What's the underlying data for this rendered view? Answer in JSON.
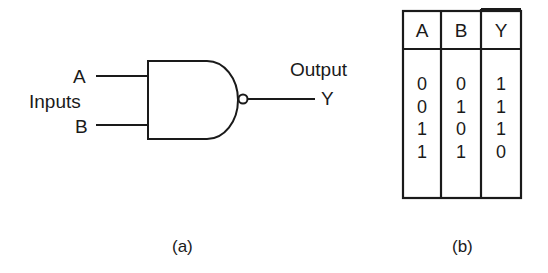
{
  "gate": {
    "type": "NAND",
    "inputs_label": "Inputs",
    "input_a_label": "A",
    "input_b_label": "B",
    "output_label": "Output",
    "output_y_label": "Y"
  },
  "truth_table": {
    "headers": [
      "A",
      "B",
      "Y"
    ],
    "columns": {
      "A": [
        "0",
        "0",
        "1",
        "1"
      ],
      "B": [
        "0",
        "1",
        "0",
        "1"
      ],
      "Y": [
        "1",
        "1",
        "1",
        "0"
      ]
    },
    "rows": [
      {
        "A": "0",
        "B": "0",
        "Y": "1"
      },
      {
        "A": "0",
        "B": "1",
        "Y": "1"
      },
      {
        "A": "1",
        "B": "0",
        "Y": "1"
      },
      {
        "A": "1",
        "B": "1",
        "Y": "0"
      }
    ]
  },
  "captions": {
    "a": "(a)",
    "b": "(b)"
  },
  "colors": {
    "ink": "#1a1a1a",
    "background": "#ffffff"
  }
}
